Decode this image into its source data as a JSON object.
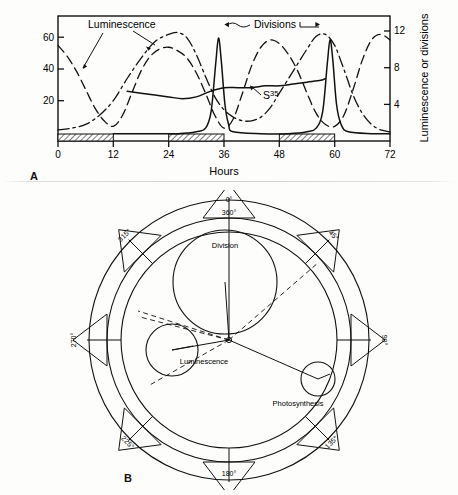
{
  "figure": {
    "panel_a_letter": "A",
    "panel_b_letter": "B"
  },
  "chart_data": [
    {
      "id": "panel_a",
      "type": "line",
      "title": "",
      "xlabel": "Hours",
      "ylabel_left": "",
      "ylabel_right": "Luminescence or divisions",
      "xlim": [
        0,
        72
      ],
      "ylim_left": [
        0,
        68
      ],
      "ylim_right": [
        0,
        13.6
      ],
      "xticks": [
        "0",
        "12",
        "24",
        "36",
        "48",
        "60",
        "72"
      ],
      "xtick_values": [
        0,
        12,
        24,
        36,
        48,
        60,
        72
      ],
      "yticks_left": [
        "20",
        "40",
        "60"
      ],
      "ytick_left_values": [
        20,
        40,
        60
      ],
      "yticks_right": [
        "4",
        "8",
        "12"
      ],
      "ytick_right_values": [
        4,
        8,
        12
      ],
      "grid": false,
      "legend_position": "inline-annotations",
      "annotations": [
        {
          "name": "luminescence-label",
          "text": "Luminescence",
          "x": 22,
          "y": 62
        },
        {
          "name": "divisions-label",
          "text": "Divisions",
          "x": 45,
          "y": 63
        },
        {
          "name": "s35-label",
          "text": "S",
          "superscript": "35",
          "x": 41,
          "y": 24
        }
      ],
      "dark_bars": [
        {
          "start": 0,
          "end": 12
        },
        {
          "start": 24,
          "end": 36
        },
        {
          "start": 48,
          "end": 60
        }
      ],
      "series": [
        {
          "name": "Luminescence",
          "style": "dashed",
          "points": [
            [
              0,
              52
            ],
            [
              2,
              46
            ],
            [
              4,
              38
            ],
            [
              6,
              28
            ],
            [
              8,
              18
            ],
            [
              10,
              11
            ],
            [
              12,
              8
            ],
            [
              14,
              14
            ],
            [
              16,
              26
            ],
            [
              18,
              38
            ],
            [
              20,
              46
            ],
            [
              22,
              50
            ],
            [
              24,
              51
            ],
            [
              26,
              49
            ],
            [
              28,
              45
            ],
            [
              30,
              37
            ],
            [
              32,
              26
            ],
            [
              34,
              14
            ],
            [
              36,
              7
            ],
            [
              38,
              12
            ],
            [
              40,
              26
            ],
            [
              42,
              41
            ],
            [
              44,
              51
            ],
            [
              46,
              55
            ],
            [
              48,
              53
            ],
            [
              50,
              47
            ],
            [
              52,
              38
            ],
            [
              54,
              26
            ],
            [
              56,
              15
            ],
            [
              58,
              9
            ],
            [
              60,
              8
            ],
            [
              62,
              14
            ],
            [
              64,
              28
            ],
            [
              66,
              44
            ],
            [
              68,
              55
            ],
            [
              70,
              58
            ],
            [
              72,
              55
            ]
          ]
        },
        {
          "name": "Photosynthesis",
          "style": "dash-dot",
          "points": [
            [
              0,
              6
            ],
            [
              3,
              7
            ],
            [
              6,
              9
            ],
            [
              9,
              14
            ],
            [
              12,
              22
            ],
            [
              15,
              34
            ],
            [
              18,
              45
            ],
            [
              21,
              54
            ],
            [
              24,
              58
            ],
            [
              26,
              59
            ],
            [
              28,
              56
            ],
            [
              30,
              47
            ],
            [
              32,
              35
            ],
            [
              34,
              24
            ],
            [
              36,
              17
            ],
            [
              38,
              13
            ],
            [
              40,
              11
            ],
            [
              42,
              11
            ],
            [
              44,
              13
            ],
            [
              46,
              18
            ],
            [
              48,
              26
            ],
            [
              51,
              38
            ],
            [
              54,
              50
            ],
            [
              56,
              57
            ],
            [
              58,
              58
            ],
            [
              60,
              52
            ],
            [
              62,
              39
            ],
            [
              64,
              25
            ],
            [
              66,
              15
            ],
            [
              68,
              9
            ],
            [
              70,
              6
            ],
            [
              72,
              5
            ]
          ]
        },
        {
          "name": "Divisions",
          "style": "solid",
          "points": [
            [
              12,
              4
            ],
            [
              20,
              4
            ],
            [
              26,
              4
            ],
            [
              30,
              5
            ],
            [
              32,
              7
            ],
            [
              33.2,
              16
            ],
            [
              34.2,
              42
            ],
            [
              34.8,
              56
            ],
            [
              35.4,
              44
            ],
            [
              36.2,
              20
            ],
            [
              37,
              9
            ],
            [
              38,
              5
            ],
            [
              44,
              4
            ],
            [
              50,
              4
            ],
            [
              54,
              5
            ],
            [
              56,
              7
            ],
            [
              57.4,
              16
            ],
            [
              58.4,
              42
            ],
            [
              59.0,
              55
            ],
            [
              59.6,
              44
            ],
            [
              60.4,
              20
            ],
            [
              61.4,
              9
            ],
            [
              63,
              5
            ],
            [
              68,
              4
            ],
            [
              72,
              4
            ]
          ]
        },
        {
          "name": "S35",
          "style": "solid",
          "points": [
            [
              15,
              27
            ],
            [
              18,
              26
            ],
            [
              21,
              25
            ],
            [
              24,
              24
            ],
            [
              27,
              23
            ],
            [
              30,
              24
            ],
            [
              33,
              27
            ],
            [
              36,
              29
            ],
            [
              39,
              29
            ],
            [
              42,
              29
            ],
            [
              45,
              30
            ],
            [
              48,
              30
            ],
            [
              51,
              31
            ],
            [
              54,
              32
            ],
            [
              57,
              33
            ],
            [
              58,
              34
            ]
          ]
        }
      ]
    },
    {
      "id": "panel_b",
      "type": "polar_phase_diagram",
      "title": "",
      "degree_labels": [
        {
          "label": "0°",
          "value": 0,
          "position": "top-outer"
        },
        {
          "label": "360°",
          "value": 360,
          "position": "top-inner"
        },
        {
          "label": "45°",
          "value": 45,
          "position": "upper-right"
        },
        {
          "label": "90°",
          "value": 90,
          "position": "right"
        },
        {
          "label": "135°",
          "value": 135,
          "position": "lower-right"
        },
        {
          "label": "180°",
          "value": 180,
          "position": "bottom"
        },
        {
          "label": "225°",
          "value": 225,
          "position": "lower-left"
        },
        {
          "label": "270°",
          "value": 270,
          "position": "left"
        },
        {
          "label": "315°",
          "value": 315,
          "position": "upper-left"
        }
      ],
      "phase_markers": [
        {
          "name": "Division",
          "angle": 350,
          "radius_fraction": 0.48,
          "size": "large"
        },
        {
          "name": "Luminescence",
          "angle": 268,
          "radius_fraction": 0.46,
          "size": "medium"
        },
        {
          "name": "Photosynthesis",
          "angle": 130,
          "radius_fraction": 0.62,
          "size": "small"
        }
      ]
    }
  ]
}
